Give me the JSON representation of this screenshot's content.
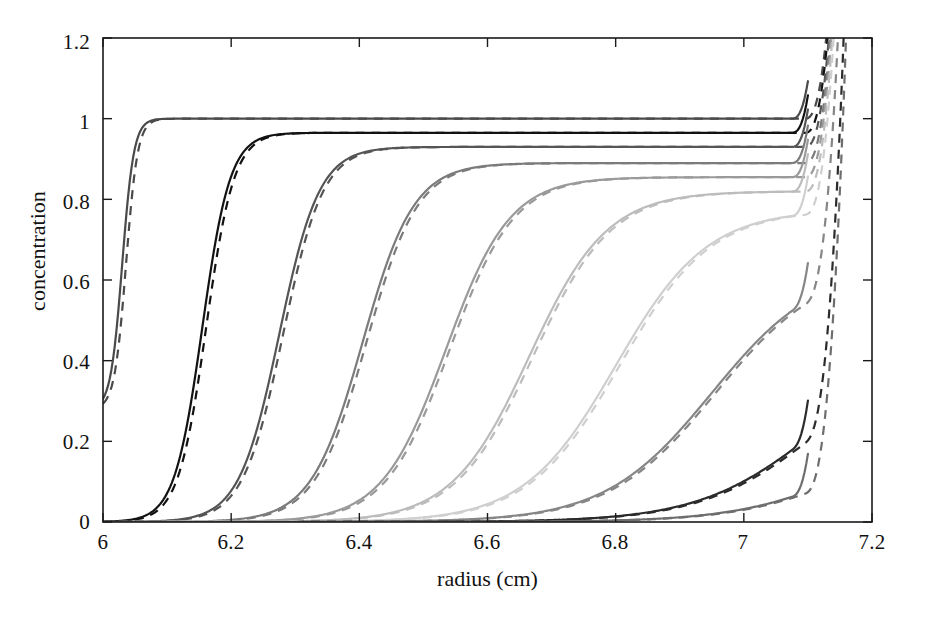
{
  "chart_data": {
    "type": "line",
    "title": "",
    "xlabel": "radius (cm)",
    "ylabel": "concentration",
    "xlim": [
      6,
      7.2
    ],
    "ylim": [
      0,
      1.2
    ],
    "xticks": [
      "6",
      "6.2",
      "6.4",
      "6.6",
      "6.8",
      "7",
      "7.2"
    ],
    "xtick_values": [
      6,
      6.2,
      6.4,
      6.6,
      6.8,
      7,
      7.2
    ],
    "yticks": [
      "0",
      "0.2",
      "0.4",
      "0.6",
      "0.8",
      "1",
      "1.2"
    ],
    "ytick_values": [
      0,
      0.2,
      0.4,
      0.6,
      0.8,
      1,
      1.2
    ],
    "grid": false,
    "legend": false,
    "legend_position": "none",
    "line_styles": [
      "solid (simulation)",
      "dashed (model fit)"
    ],
    "series": [
      {
        "name": "scan 1",
        "color": "#4a4a4a",
        "plateau": 1.0,
        "midpoint": 6.03,
        "steepness": 110,
        "base_value": 0.0,
        "left_edge_value": 0.28,
        "solid_end_x": 7.1,
        "dashed_end_x": 7.13
      },
      {
        "name": "scan 2",
        "color": "#121212",
        "plateau": 0.965,
        "midpoint": 6.155,
        "steepness": 46,
        "base_value": 0.0,
        "left_edge_value": 0.005,
        "solid_end_x": 7.1,
        "dashed_end_x": 7.14
      },
      {
        "name": "scan 3",
        "color": "#555555",
        "plateau": 0.93,
        "midpoint": 6.275,
        "steepness": 32,
        "base_value": 0.0,
        "left_edge_value": 0.003,
        "solid_end_x": 7.1,
        "dashed_end_x": 7.145
      },
      {
        "name": "scan 4",
        "color": "#7b7b7b",
        "plateau": 0.89,
        "midpoint": 6.405,
        "steepness": 25,
        "base_value": 0.0,
        "left_edge_value": 0.002,
        "solid_end_x": 7.1,
        "dashed_end_x": 7.15
      },
      {
        "name": "scan 5",
        "color": "#9a9a9a",
        "plateau": 0.855,
        "midpoint": 6.535,
        "steepness": 20,
        "base_value": 0.0,
        "left_edge_value": 0.001,
        "solid_end_x": 7.1,
        "dashed_end_x": 7.152
      },
      {
        "name": "scan 6",
        "color": "#bcbcbc",
        "plateau": 0.82,
        "midpoint": 6.665,
        "steepness": 16.5,
        "base_value": 0.0,
        "left_edge_value": 0.0,
        "solid_end_x": 7.1,
        "dashed_end_x": 7.155
      },
      {
        "name": "scan 7",
        "color": "#cfcfcf",
        "plateau": 0.775,
        "midpoint": 6.8,
        "steepness": 14,
        "base_value": 0.0,
        "left_edge_value": 0.0,
        "solid_end_x": 7.1,
        "dashed_end_x": 7.158
      },
      {
        "name": "scan 8",
        "color": "#868686",
        "plateau": 0.64,
        "midpoint": 6.95,
        "steepness": 12,
        "base_value": 0.0,
        "left_edge_value": 0.0,
        "solid_end_x": 7.1,
        "dashed_end_x": 7.16
      },
      {
        "name": "scan 9",
        "color": "#2b2b2b",
        "plateau": 0.44,
        "midpoint": 7.11,
        "steepness": 11,
        "base_value": 0.0,
        "left_edge_value": 0.0,
        "solid_end_x": 7.1,
        "dashed_end_x": 7.16
      },
      {
        "name": "scan 10",
        "color": "#6e6e6e",
        "plateau": 0.24,
        "midpoint": 7.17,
        "steepness": 11,
        "base_value": 0.0,
        "left_edge_value": 0.0,
        "solid_end_x": 7.1,
        "dashed_end_x": 7.16
      }
    ],
    "plateau_values_at_r710": [
      1.0,
      0.965,
      0.93,
      0.89,
      0.855,
      0.82,
      0.775,
      0.6,
      0.38,
      0.19
    ]
  },
  "axes": {
    "x_title": "radius (cm)",
    "y_title": "concentration"
  },
  "style": {
    "axis_color": "#1a1a1a",
    "background": "#ffffff"
  }
}
